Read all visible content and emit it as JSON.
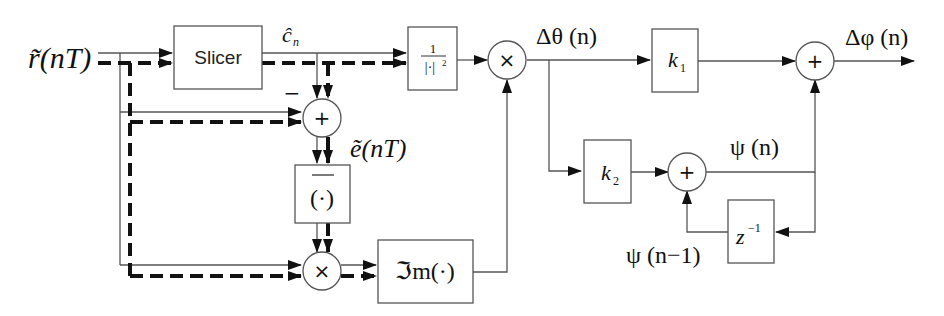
{
  "diagram": {
    "input_label": "r̃(nT)",
    "blocks": {
      "slicer": "Slicer",
      "slicer_output": "ĉ",
      "slicer_output_sub": "n",
      "inv_mag_num": "1",
      "inv_mag_den": "|·|",
      "inv_mag_pow": "2",
      "conj": "(·)",
      "imag": "ℑm(·)",
      "k1": "k",
      "k1_sub": "1",
      "k2": "k",
      "k2_sub": "2",
      "delay": "z",
      "delay_pow": "−1"
    },
    "nodes": {
      "sum_error": "+",
      "sum_error_minus": "−",
      "mult_conj": "×",
      "mult_norm": "×",
      "sum_integrator": "+",
      "sum_output": "+"
    },
    "signals": {
      "error": "ẽ(nT)",
      "delta_theta": "Δθ (n)",
      "psi": "ψ (n)",
      "psi_prev": "ψ (n−1)",
      "delta_phi": "Δφ (n)"
    }
  }
}
